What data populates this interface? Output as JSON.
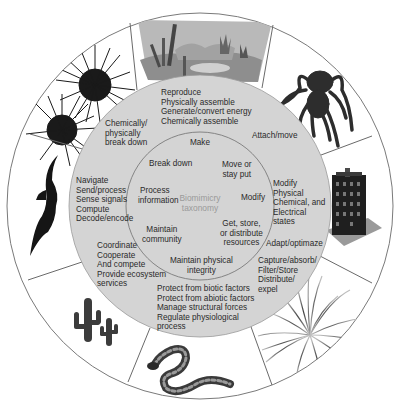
{
  "diagram": {
    "title": "Biomimicry taxonomy",
    "center_label": [
      "Biomimicry",
      "taxonomy"
    ],
    "colors": {
      "outer_ring_bg": "#ffffff",
      "middle_disk": "#d4d4d4",
      "inner_disk": "#d4d4d4",
      "ring_stroke": "#7a7a7a",
      "text": "#2a2a2a",
      "center_text": "#9a9a9a"
    },
    "inner_categories": [
      {
        "id": "make",
        "lines": [
          "Make"
        ]
      },
      {
        "id": "move",
        "lines": [
          "Move or",
          "stay put"
        ]
      },
      {
        "id": "modify",
        "lines": [
          "Modify"
        ]
      },
      {
        "id": "resources",
        "lines": [
          "Get, store,",
          "or distribute",
          "resources"
        ]
      },
      {
        "id": "integrity",
        "lines": [
          "Maintain physical",
          "integrity"
        ]
      },
      {
        "id": "community",
        "lines": [
          "Maintain",
          "community"
        ]
      },
      {
        "id": "information",
        "lines": [
          "Process",
          "information"
        ]
      },
      {
        "id": "breakdown",
        "lines": [
          "Break down"
        ]
      }
    ],
    "middle_functions": [
      {
        "id": "make",
        "lines": [
          "Reproduce",
          "Physically assemble",
          "Generate/convert energy",
          "Chemically assemble"
        ]
      },
      {
        "id": "move",
        "lines": [
          "Attach/move"
        ]
      },
      {
        "id": "modify",
        "lines": [
          "Modify",
          "Physical",
          "Chemical, and",
          "Electrical",
          "states"
        ]
      },
      {
        "id": "adapt",
        "lines": [
          "Adapt/optimaze"
        ]
      },
      {
        "id": "resources",
        "lines": [
          "Capture/absorb/",
          "Filter/Store",
          "Distribute/",
          "expel"
        ]
      },
      {
        "id": "integrity",
        "lines": [
          "Protect from biotic factors",
          "Protect from abiotic factors",
          "Manage structural forces",
          "Regulate physiological",
          "process"
        ]
      },
      {
        "id": "community",
        "lines": [
          "Coordinate",
          "Cooperate",
          "And compete",
          "Provide ecosystem",
          "services"
        ]
      },
      {
        "id": "information",
        "lines": [
          "Navigate",
          "Send/process",
          "Sense signals",
          "Compute",
          "Decode/encode"
        ]
      },
      {
        "id": "breakdown",
        "lines": [
          "Chemically/",
          "physically",
          "break down"
        ]
      }
    ],
    "outer_images": [
      {
        "id": "landscape",
        "icon": "landscape-icon",
        "position": "top"
      },
      {
        "id": "spider",
        "icon": "spider-icon",
        "position": "top-right"
      },
      {
        "id": "building",
        "icon": "building-icon",
        "position": "right"
      },
      {
        "id": "grass",
        "icon": "grass-plant-icon",
        "position": "bottom-right"
      },
      {
        "id": "snake",
        "icon": "snake-icon",
        "position": "bottom"
      },
      {
        "id": "cactus",
        "icon": "cactus-icon",
        "position": "bottom-left"
      },
      {
        "id": "bat",
        "icon": "bat-icon",
        "position": "left"
      },
      {
        "id": "urchin",
        "icon": "sea-urchin-icon",
        "position": "top-left"
      }
    ]
  }
}
